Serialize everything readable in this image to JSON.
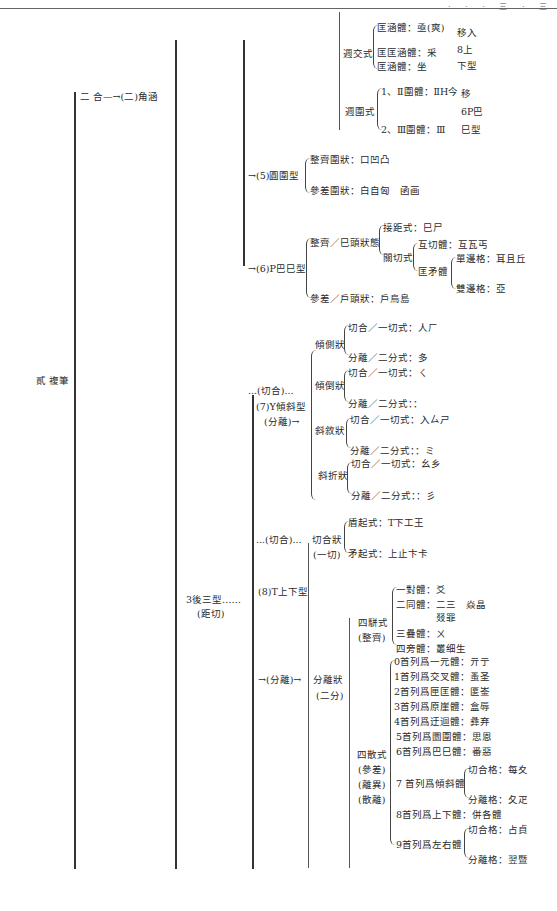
{
  "header": {
    "page_marks": "·  ·  ·  三 · 三"
  },
  "root": {
    "label": "貳 複筆"
  },
  "level1": {
    "he": "二 合—→(二)角涵",
    "houtype": "3後三型……",
    "houtype_sub": "(距切)"
  },
  "jiaohan": {
    "zhoujiao": {
      "label": "週交式",
      "items": [
        "匡涵體：亟(爽)",
        "匡匡涵體：采",
        "匡涵體：坐"
      ],
      "side": [
        "移入",
        "8上",
        "下型"
      ]
    },
    "zhouwei": {
      "label": "週圍式",
      "items": [
        "1、Ⅱ圍體：ⅡH今",
        "2、Ⅲ圍體：Ⅲ"
      ],
      "side": [
        "移",
        "6P巴",
        "巳型"
      ]
    }
  },
  "type5": {
    "label": "→(5)圓圍型",
    "items": [
      "整齊圍狀：口凹凸",
      "參差圍狀：白自匈　函画"
    ]
  },
  "type6": {
    "label": "→(6)P巴巳型",
    "zhengqi": "整齊／巳頭狀態",
    "jieju": "接距式：巳尸",
    "guanqie": "關切式",
    "huqie": "互切體：互瓦丐",
    "kuangmao": "匡矛體",
    "danbian": "單邊格：耳且丘",
    "shuangbian": "雙邊格：亞",
    "cenci": "參差／戶頭狀：戶烏島"
  },
  "type7": {
    "qiehe": "...(切合)...",
    "label": "(7)Y傾斜型",
    "fenli": "(分離)→",
    "groups": [
      {
        "label": "傾側狀",
        "a": "切合／一切式：人ㄏ",
        "b": "分離／二分式：多"
      },
      {
        "label": "傾倒狀",
        "a": "切合／一切式：ㄑ",
        "b": "分離／二分式：："
      },
      {
        "label": "斜敘狀",
        "a": "切合／一切式：入ㄙㄕ",
        "b": "分離／二分式：：ミ"
      },
      {
        "label": "斜折狀",
        "a": "切合／一切式：幺乡",
        "b": "分離／二分式：：彡"
      }
    ]
  },
  "type8": {
    "qiehe": "...(切合)...",
    "qiehezhuang": "切合狀",
    "yiqie": "(一切)",
    "label": "(8)T上下型",
    "fenli": "→(分離)→",
    "fenlizhuang": "分離狀",
    "erfen": "(二分)",
    "dunqi": "盾起式：T下工王",
    "maoqi": "矛起式：上止卞卡",
    "siping": {
      "label": "四駢式",
      "sub": "(整齊)",
      "items": [
        "一對體：爻",
        "二同體：二三　焱晶",
        "　　　　叕罪",
        "三疊體：ㄨ",
        "四旁體：叢细生"
      ]
    },
    "sisan": {
      "label": "四散式",
      "subs": [
        "(參差)",
        "(離異)",
        "(散離)"
      ],
      "items": [
        "0首列爲一元體：亓亍",
        "1首列爲交叉體：蚤圣",
        "2首列爲匣匡體：匽崟",
        "3首列爲原崖體：盒辱",
        "4首列爲迂迴體：彝弃",
        "5首列爲圜圍體：思恩",
        "6首列爲巴巳體：番惡"
      ],
      "item7": "7 首列爲傾斜體",
      "item7a": "切合格：每夊",
      "item7b": "分離格：夂疋",
      "item8": "8首列爲上下體：併各體",
      "item9": "9首列爲左右體",
      "item9a": "切合格：占貞",
      "item9b": "分離格：翌暨"
    }
  }
}
